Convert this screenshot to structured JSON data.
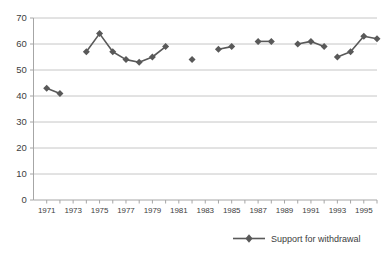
{
  "chart_data": {
    "type": "line",
    "title": "",
    "subtitle": "",
    "xlabel": "",
    "ylabel": "",
    "grid": true,
    "legend_position": "bottom-right",
    "xlim": [
      1970,
      1996
    ],
    "ylim": [
      0,
      70
    ],
    "ytick_step": 10,
    "yticks": [
      0,
      10,
      20,
      30,
      40,
      50,
      60,
      70
    ],
    "ytick_labels": [
      "0",
      "10",
      "20",
      "30",
      "40",
      "50",
      "60",
      "70"
    ],
    "xticks": [
      1971,
      1972,
      1973,
      1974,
      1975,
      1976,
      1977,
      1978,
      1979,
      1980,
      1981,
      1982,
      1983,
      1984,
      1985,
      1986,
      1987,
      1988,
      1989,
      1990,
      1991,
      1992,
      1993,
      1994,
      1995,
      1996
    ],
    "xtick_labels_shown": [
      "1971",
      "1973",
      "1975",
      "1977",
      "1979",
      "1981",
      "1983",
      "1985",
      "1987",
      "1989",
      "1991",
      "1993",
      "1995"
    ],
    "series": [
      {
        "name": "Support for withdrawal",
        "color": "#595959",
        "marker": "diamond",
        "x": [
          1971,
          1972,
          1974,
          1975,
          1976,
          1977,
          1978,
          1979,
          1980,
          1982,
          1984,
          1985,
          1987,
          1988,
          1990,
          1991,
          1992,
          1993,
          1994,
          1995,
          1996
        ],
        "values": [
          43,
          41,
          57,
          64,
          57,
          54,
          53,
          55,
          59,
          54,
          58,
          59,
          61,
          61,
          60,
          61,
          59,
          55,
          57,
          63,
          62
        ],
        "segments": [
          {
            "x": [
              1971,
              1972
            ],
            "values": [
              43,
              41
            ]
          },
          {
            "x": [
              1974,
              1975,
              1976,
              1977,
              1978,
              1979,
              1980
            ],
            "values": [
              57,
              64,
              57,
              54,
              53,
              55,
              59
            ]
          },
          {
            "x": [
              1982
            ],
            "values": [
              54
            ]
          },
          {
            "x": [
              1984,
              1985
            ],
            "values": [
              58,
              59
            ]
          },
          {
            "x": [
              1987,
              1988
            ],
            "values": [
              61,
              61
            ]
          },
          {
            "x": [
              1990,
              1991,
              1992
            ],
            "values": [
              60,
              61,
              59
            ]
          },
          {
            "x": [
              1993,
              1994,
              1995,
              1996
            ],
            "values": [
              55,
              57,
              63,
              62
            ]
          }
        ]
      }
    ]
  },
  "legend": {
    "entries": [
      {
        "label": "Support for withdrawal",
        "color": "#595959"
      }
    ]
  },
  "colors": {
    "series": "#595959",
    "gridline": "#c6c6c6",
    "axis": "#a6a6a6",
    "text": "#404040",
    "background": "#ffffff"
  }
}
